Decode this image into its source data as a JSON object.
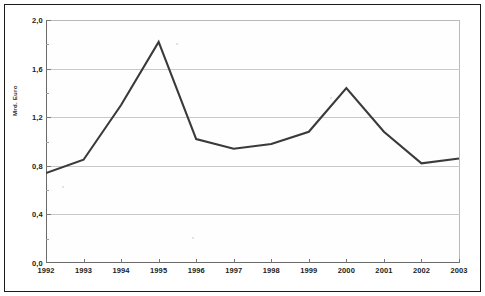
{
  "chart_data": {
    "type": "line",
    "title": "",
    "subtitle": "",
    "xlabel": "",
    "ylabel": "Mrd. Euro",
    "categories": [
      "1992",
      "1993",
      "1994",
      "1995",
      "1996",
      "1997",
      "1998",
      "1999",
      "2000",
      "2001",
      "2002",
      "2003"
    ],
    "values": [
      0.74,
      0.85,
      1.3,
      1.82,
      1.02,
      0.94,
      0.98,
      1.08,
      1.44,
      1.08,
      0.82,
      0.86
    ],
    "series": [
      {
        "name": "Mrd. Euro",
        "values": [
          0.74,
          0.85,
          1.3,
          1.82,
          1.02,
          0.94,
          0.98,
          1.08,
          1.44,
          1.08,
          0.82,
          0.86
        ]
      }
    ],
    "ylim": [
      0.0,
      2.0
    ],
    "ytick_values": [
      0.0,
      0.4,
      0.8,
      1.2,
      1.6,
      2.0
    ],
    "ytick_labels": [
      "0,0",
      "0,4",
      "0,8",
      "1,2",
      "1,6",
      "2,0"
    ],
    "grid": true,
    "grid_axis": "y",
    "legend": false,
    "legend_position": "none",
    "line_color": "#3a3a3a",
    "grid_color": "#c9c9c9",
    "background_color": "#ffffff",
    "decimal_separator": ","
  },
  "figure": {
    "frame_color": "#1a1a1a",
    "plot_background": "#fefefe"
  }
}
